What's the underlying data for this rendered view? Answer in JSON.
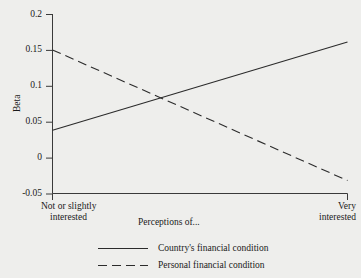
{
  "chart_data": {
    "type": "line",
    "title": "",
    "subtitle": "",
    "xlabel": "Perceptions of...",
    "ylabel": "Beta",
    "x": [
      0,
      1
    ],
    "xtick_labels": [
      "Not or slightly interested",
      "Very interested"
    ],
    "xtick_label_lines": [
      [
        "Not or slightly",
        "interested"
      ],
      [
        "Very",
        "interested"
      ]
    ],
    "ytick_labels": [
      "0.2",
      "0.15",
      "0.1",
      "0.05",
      "0",
      "-0.05"
    ],
    "ytick_values": [
      0.2,
      0.15,
      0.1,
      0.05,
      0,
      -0.05
    ],
    "ylim": [
      -0.05,
      0.2
    ],
    "xlim": [
      0,
      1
    ],
    "grid": false,
    "legend_position": "bottom-center",
    "series": [
      {
        "name": "Country's financial condition",
        "style": "solid",
        "color": "#2b2b2b",
        "values": [
          0.038,
          0.161
        ]
      },
      {
        "name": "Personal financial condition",
        "style": "dashed",
        "color": "#2b2b2b",
        "values": [
          0.15,
          -0.032
        ]
      }
    ],
    "annotations": [
      {
        "text": "lines cross near Beta = 0.079",
        "x": 0.38,
        "y": 0.079
      }
    ]
  },
  "axis": {
    "y_title": "Beta",
    "y_ticks": [
      "0.2",
      "0.15",
      "0.1",
      "0.05",
      "0",
      "-0.05"
    ],
    "x_left_line1": "Not or slightly",
    "x_left_line2": "interested",
    "x_right_line1": "Very",
    "x_right_line2": "interested",
    "x_center_caption": "Perceptions of..."
  },
  "legend": {
    "items": [
      {
        "label": "Country's financial condition",
        "marker": "solid-line-swatch"
      },
      {
        "label": "Personal financial condition",
        "marker": "dashed-line-swatch"
      }
    ]
  },
  "style": {
    "background": "#eeeeec",
    "ink": "#2b2b2b"
  }
}
